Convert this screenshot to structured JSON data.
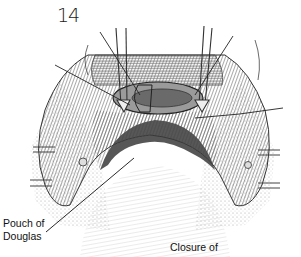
{
  "figure": {
    "number": "14",
    "labels": {
      "pouch_line1": "Pouch of",
      "pouch_line2": "Douglas",
      "caption": "Closure of"
    },
    "colors": {
      "ink": "#222222",
      "tissue_dark": "#4a4a4a",
      "tissue_mid": "#8a8a8a",
      "tissue_light": "#c8c8c8",
      "background": "#ffffff"
    }
  }
}
